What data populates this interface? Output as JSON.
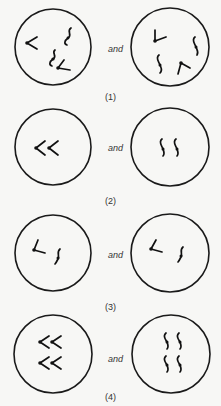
{
  "figure": {
    "connector": "and",
    "panels": [
      {
        "label": "(1)",
        "left": "four chromosomes: two V-shaped (metacentric-like), two J/S-shaped",
        "right": "four chromosomes: two L-shaped, two S-shaped"
      },
      {
        "label": "(2)",
        "left": "two V-shaped chromosomes side by side",
        "right": "two S-shaped chromosomes side by side"
      },
      {
        "label": "(3)",
        "left": "one L-shaped and one S-shaped chromosome",
        "right": "one L-shaped and one S-shaped chromosome"
      },
      {
        "label": "(4)",
        "left": "four V-shaped chromosomes in two pairs",
        "right": "four S-shaped chromosomes in two pairs"
      }
    ]
  }
}
